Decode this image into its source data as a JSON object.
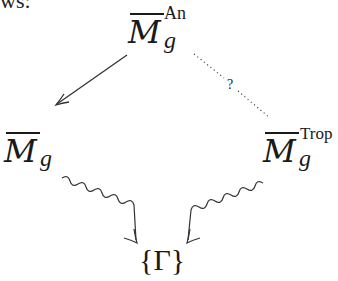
{
  "preceding_text_fragment": "ws:",
  "nodes": {
    "top": {
      "base": "M",
      "overline": true,
      "subscript": "g",
      "superscript": "An"
    },
    "left": {
      "base": "M",
      "overline": true,
      "subscript": "g",
      "superscript": ""
    },
    "right": {
      "base": "M",
      "overline": true,
      "subscript": "g",
      "superscript": "Trop"
    },
    "bottom": {
      "label": "{Γ}"
    }
  },
  "edges": [
    {
      "from": "top",
      "to": "left",
      "style": "solid-arrow",
      "label": ""
    },
    {
      "from": "top",
      "to": "right",
      "style": "dotted",
      "label": "?"
    },
    {
      "from": "left",
      "to": "bottom",
      "style": "squiggly-arrow",
      "label": ""
    },
    {
      "from": "right",
      "to": "bottom",
      "style": "squiggly-arrow",
      "label": ""
    }
  ],
  "colors": {
    "ink": "#1a1a1a",
    "background": "#ffffff"
  }
}
